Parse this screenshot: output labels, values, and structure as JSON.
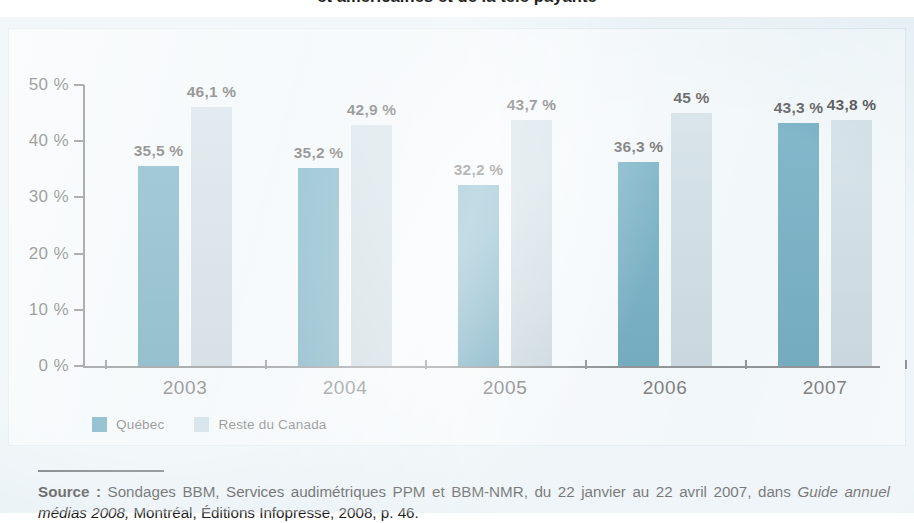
{
  "title": "et américaines et de la télé payante",
  "legend": {
    "position": "bottom-left",
    "items": [
      {
        "label": "Québec",
        "color": "#1a7b9e",
        "swatch_name": "legend-swatch-quebec"
      },
      {
        "label": "Reste du Canada",
        "color": "#aec6d4",
        "swatch_name": "legend-swatch-reste-du-canada"
      }
    ]
  },
  "source": {
    "label": "Source :",
    "text_part1": " Sondages BBM, Services audimétriques PPM et BBM-NMR, du 22 janvier au 22 avril 2007, dans ",
    "italic": "Guide annuel médias 2008,",
    "text_part2": " Montréal, Éditions Infopresse, 2008, p. 46."
  },
  "colors": {
    "quebec": "#1a7b9e",
    "reste_du_canada": "#aec6d4",
    "panel_background": "#e4eef3",
    "chart_background": "#e8f1f5",
    "axis": "#4a4f52"
  },
  "chart_data": {
    "type": "bar",
    "title": "et américaines et de la télé payante",
    "xlabel": "",
    "ylabel": "",
    "ylim": [
      0,
      50
    ],
    "grid": false,
    "legend_position": "bottom-left",
    "yticks": [
      0,
      10,
      20,
      30,
      40,
      50
    ],
    "ytick_labels": [
      "0 %",
      "10 %",
      "20 %",
      "30 %",
      "40 %",
      "50 %"
    ],
    "categories": [
      "2003",
      "2004",
      "2005",
      "2006",
      "2007"
    ],
    "series": [
      {
        "name": "Québec",
        "color": "#1a7b9e",
        "values": [
          35.5,
          35.2,
          32.2,
          36.3,
          43.3
        ],
        "labels": [
          "35,5 %",
          "35,2 %",
          "32,2 %",
          "36,3 %",
          "43,3 %"
        ]
      },
      {
        "name": "Reste du Canada",
        "color": "#aec6d4",
        "values": [
          46.1,
          42.9,
          43.7,
          45.0,
          43.8
        ],
        "labels": [
          "46,1 %",
          "42,9 %",
          "43,7 %",
          "45 %",
          "43,8 %"
        ]
      }
    ]
  }
}
